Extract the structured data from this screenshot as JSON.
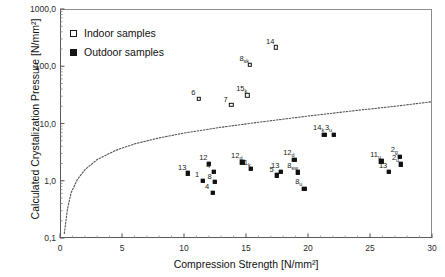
{
  "chart_data": {
    "type": "scatter",
    "title": "",
    "xlabel": "Compression Strength [N/mm²]",
    "ylabel": "Calculated Crystalization Pressure [N/mm²]",
    "xlim": [
      0,
      30
    ],
    "ylim": [
      0.1,
      1000
    ],
    "yscale": "log",
    "xscale": "linear",
    "grid": false,
    "legend_position": "upper-left-inside",
    "xticks": [
      "0",
      "5",
      "10",
      "15",
      "20",
      "25",
      "30"
    ],
    "xtick_values": [
      0,
      5,
      10,
      15,
      20,
      25,
      30
    ],
    "yticks": [
      "0,1",
      "1,0",
      "10,0",
      "100,0",
      "1000,0"
    ],
    "ytick_values": [
      0.1,
      1,
      10,
      100,
      1000
    ],
    "legend": [
      {
        "label": "Indoor samples",
        "marker": "open-square"
      },
      {
        "label": "Outdoor samples",
        "marker": "filled-square"
      }
    ],
    "series": [
      {
        "name": "Indoor samples",
        "marker": "open-square",
        "points": [
          {
            "label": "6",
            "sub": "",
            "x": 11.2,
            "y": 27.0
          },
          {
            "label": "7",
            "sub": "",
            "x": 13.8,
            "y": 21.0
          },
          {
            "label": "8",
            "sub": "sk",
            "x": 15.3,
            "y": 105.0
          },
          {
            "label": "14",
            "sub": "",
            "x": 17.4,
            "y": 215.0
          },
          {
            "label": "15",
            "sub": "k",
            "x": 15.1,
            "y": 31.0
          }
        ]
      },
      {
        "name": "Outdoor samples",
        "marker": "filled-square",
        "points": [
          {
            "label": "13",
            "sub": "",
            "x": 10.3,
            "y": 1.35
          },
          {
            "label": "1",
            "sub": "",
            "x": 11.5,
            "y": 1.0
          },
          {
            "label": "12",
            "sub": "",
            "x": 12.0,
            "y": 2.0
          },
          {
            "label": "4",
            "sub": "",
            "x": 12.4,
            "y": 1.45
          },
          {
            "label": "8",
            "sub": "",
            "x": 12.5,
            "y": 0.95
          },
          {
            "label": "4",
            "sub": "",
            "x": 12.3,
            "y": 0.62
          },
          {
            "label": "12",
            "sub": "d",
            "x": 14.7,
            "y": 2.1
          },
          {
            "label": "11",
            "sub": "k",
            "x": 15.4,
            "y": 1.6
          },
          {
            "label": "5",
            "sub": "",
            "x": 17.5,
            "y": 1.25
          },
          {
            "label": "13",
            "sub": "",
            "x": 17.8,
            "y": 1.45
          },
          {
            "label": "12",
            "sub": "d",
            "x": 18.9,
            "y": 2.35
          },
          {
            "label": "8",
            "sub": "sw",
            "x": 19.2,
            "y": 1.4
          },
          {
            "label": "8",
            "sub": "u",
            "x": 19.7,
            "y": 0.72
          },
          {
            "label": "14",
            "sub": "k",
            "x": 21.3,
            "y": 6.3
          },
          {
            "label": "3",
            "sub": "u",
            "x": 22.1,
            "y": 6.4
          },
          {
            "label": "11",
            "sub": "u",
            "x": 25.9,
            "y": 2.2
          },
          {
            "label": "13",
            "sub": "",
            "x": 26.5,
            "y": 1.45
          },
          {
            "label": "2",
            "sub": "g",
            "x": 27.4,
            "y": 2.6
          },
          {
            "label": "2",
            "sub": "u",
            "x": 27.5,
            "y": 1.95
          }
        ]
      }
    ],
    "reference_curve": {
      "style": "dotted",
      "color": "#555555",
      "description": "logarithmic threshold curve",
      "points": [
        {
          "x": 0.35,
          "y": 0.12
        },
        {
          "x": 0.6,
          "y": 0.32
        },
        {
          "x": 0.9,
          "y": 0.62
        },
        {
          "x": 1.4,
          "y": 1.05
        },
        {
          "x": 2.0,
          "y": 1.55
        },
        {
          "x": 3.0,
          "y": 2.35
        },
        {
          "x": 4.5,
          "y": 3.4
        },
        {
          "x": 6.0,
          "y": 4.4
        },
        {
          "x": 8.0,
          "y": 5.6
        },
        {
          "x": 10.0,
          "y": 6.8
        },
        {
          "x": 13.0,
          "y": 8.6
        },
        {
          "x": 16.0,
          "y": 10.5
        },
        {
          "x": 20.0,
          "y": 13.5
        },
        {
          "x": 24.0,
          "y": 17.0
        },
        {
          "x": 27.0,
          "y": 20.0
        },
        {
          "x": 30.0,
          "y": 24.0
        }
      ]
    }
  }
}
